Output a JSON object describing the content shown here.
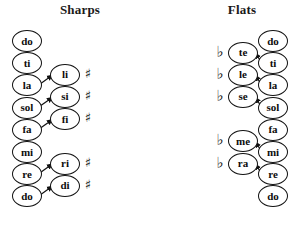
{
  "panels": {
    "sharps": {
      "title": "Sharps",
      "accidental_symbol": "♯",
      "accidental_name": "sharp-symbol",
      "main_column": [
        {
          "label": "do"
        },
        {
          "label": "ti"
        },
        {
          "label": "la"
        },
        {
          "label": "sol"
        },
        {
          "label": "fa"
        },
        {
          "label": "mi"
        },
        {
          "label": "re"
        },
        {
          "label": "do"
        }
      ],
      "altered_column": [
        {
          "label": "li",
          "from": "la"
        },
        {
          "label": "si",
          "from": "sol"
        },
        {
          "label": "fi",
          "from": "fa"
        },
        {
          "label": "ri",
          "from": "re"
        },
        {
          "label": "di",
          "from": "do"
        }
      ]
    },
    "flats": {
      "title": "Flats",
      "accidental_symbol": "♭",
      "accidental_name": "flat-symbol",
      "main_column": [
        {
          "label": "do"
        },
        {
          "label": "ti"
        },
        {
          "label": "la"
        },
        {
          "label": "sol"
        },
        {
          "label": "fa"
        },
        {
          "label": "mi"
        },
        {
          "label": "re"
        },
        {
          "label": "do"
        }
      ],
      "altered_column": [
        {
          "label": "te",
          "from": "ti"
        },
        {
          "label": "le",
          "from": "la"
        },
        {
          "label": "se",
          "from": "sol"
        },
        {
          "label": "me",
          "from": "mi"
        },
        {
          "label": "ra",
          "from": "re"
        }
      ]
    }
  },
  "colors": {
    "stroke": "#111111",
    "fill": "#ffffff",
    "text": "#0d0d0d"
  }
}
